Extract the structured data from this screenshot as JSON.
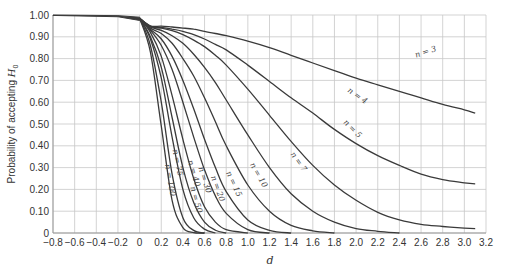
{
  "chart_data": {
    "type": "line",
    "title": "",
    "xlabel": "d",
    "ylabel": "Probability of accepting H0",
    "xlim": [
      -0.8,
      3.2
    ],
    "ylim": [
      0,
      1.0
    ],
    "grid": true,
    "legend": "inline curve labels",
    "x_ticks": [
      "-0.8",
      "-0.6",
      "-0.4",
      "-0.2",
      "0",
      "0.2",
      "0.4",
      "0.6",
      "0.8",
      "1.0",
      "1.2",
      "1.4",
      "1.6",
      "1.8",
      "2.0",
      "2.2",
      "2.4",
      "2.6",
      "2.8",
      "3.0",
      "3.2"
    ],
    "y_ticks": [
      "0",
      "0.10",
      "0.20",
      "0.30",
      "0.40",
      "0.50",
      "0.60",
      "0.70",
      "0.80",
      "0.90",
      "1.00"
    ],
    "x": [
      0,
      0.1,
      0.2,
      0.3,
      0.4,
      0.5,
      0.6,
      0.7,
      0.8,
      1.0,
      1.2,
      1.4,
      1.6,
      1.8,
      2.0,
      2.2,
      2.4,
      2.6,
      2.8,
      3.0,
      3.1
    ],
    "series": [
      {
        "name": "n = 3",
        "label_pos": [
          2.65,
          0.82,
          -18
        ],
        "values": [
          0.95,
          0.95,
          0.949,
          0.945,
          0.94,
          0.935,
          0.925,
          0.915,
          0.905,
          0.88,
          0.85,
          0.815,
          0.78,
          0.745,
          0.71,
          0.68,
          0.65,
          0.62,
          0.59,
          0.565,
          0.55
        ]
      },
      {
        "name": "n = 4",
        "label_pos": [
          2.0,
          0.62,
          35
        ],
        "values": [
          0.95,
          0.948,
          0.943,
          0.935,
          0.925,
          0.91,
          0.89,
          0.865,
          0.84,
          0.77,
          0.695,
          0.62,
          0.55,
          0.475,
          0.41,
          0.355,
          0.31,
          0.27,
          0.245,
          0.23,
          0.225
        ]
      },
      {
        "name": "n = 5",
        "label_pos": [
          1.95,
          0.47,
          45
        ],
        "values": [
          0.95,
          0.947,
          0.94,
          0.928,
          0.91,
          0.885,
          0.855,
          0.815,
          0.77,
          0.66,
          0.54,
          0.42,
          0.31,
          0.22,
          0.15,
          0.095,
          0.06,
          0.04,
          0.03,
          0.022,
          0.02
        ]
      },
      {
        "name": "n = 7",
        "label_pos": [
          1.45,
          0.32,
          55
        ],
        "values": [
          0.95,
          0.945,
          0.93,
          0.905,
          0.87,
          0.82,
          0.76,
          0.69,
          0.61,
          0.45,
          0.3,
          0.18,
          0.1,
          0.05,
          0.02,
          0.008,
          0.0,
          null,
          null,
          null,
          null
        ]
      },
      {
        "name": "n = 10",
        "label_pos": [
          1.08,
          0.26,
          60
        ],
        "values": [
          0.95,
          0.94,
          0.915,
          0.87,
          0.8,
          0.72,
          0.62,
          0.51,
          0.4,
          0.22,
          0.1,
          0.035,
          0.01,
          0.0,
          null,
          null,
          null,
          null,
          null,
          null,
          null
        ]
      },
      {
        "name": "n = 15",
        "label_pos": [
          0.85,
          0.22,
          65
        ],
        "values": [
          0.95,
          0.935,
          0.89,
          0.81,
          0.7,
          0.57,
          0.43,
          0.3,
          0.19,
          0.06,
          0.012,
          0.0,
          null,
          null,
          null,
          null,
          null,
          null,
          null,
          null,
          null
        ]
      },
      {
        "name": "n = 20",
        "label_pos": [
          0.7,
          0.2,
          70
        ],
        "values": [
          0.95,
          0.93,
          0.86,
          0.75,
          0.6,
          0.44,
          0.29,
          0.17,
          0.09,
          0.015,
          0.0,
          null,
          null,
          null,
          null,
          null,
          null,
          null,
          null,
          null,
          null
        ]
      },
      {
        "name": "n = 30",
        "label_pos": [
          0.58,
          0.24,
          72
        ],
        "values": [
          0.95,
          0.92,
          0.81,
          0.63,
          0.43,
          0.25,
          0.12,
          0.05,
          0.015,
          0.0,
          null,
          null,
          null,
          null,
          null,
          null,
          null,
          null,
          null,
          null,
          null
        ]
      },
      {
        "name": "n = 40",
        "label_pos": [
          0.48,
          0.27,
          74
        ],
        "values": [
          0.95,
          0.9,
          0.76,
          0.53,
          0.3,
          0.14,
          0.05,
          0.013,
          0.0,
          null,
          null,
          null,
          null,
          null,
          null,
          null,
          null,
          null,
          null,
          null,
          null
        ]
      },
      {
        "name": "n = 50",
        "label_pos": [
          0.5,
          0.15,
          75
        ],
        "values": [
          0.95,
          0.89,
          0.71,
          0.44,
          0.2,
          0.07,
          0.018,
          0.0,
          null,
          null,
          null,
          null,
          null,
          null,
          null,
          null,
          null,
          null,
          null,
          null,
          null
        ]
      },
      {
        "name": "n = 75",
        "label_pos": [
          0.33,
          0.32,
          78
        ],
        "values": [
          0.95,
          0.86,
          0.6,
          0.27,
          0.07,
          0.012,
          0.0,
          null,
          null,
          null,
          null,
          null,
          null,
          null,
          null,
          null,
          null,
          null,
          null,
          null,
          null
        ]
      },
      {
        "name": "n = 100",
        "label_pos": [
          0.26,
          0.24,
          80
        ],
        "values": [
          0.95,
          0.83,
          0.49,
          0.15,
          0.025,
          0.002,
          0.0,
          null,
          null,
          null,
          null,
          null,
          null,
          null,
          null,
          null,
          null,
          null,
          null,
          null,
          null
        ]
      }
    ],
    "left_segment": {
      "x": [
        -0.8,
        -0.2,
        0
      ],
      "value_top": 1.0,
      "value_bottom": 0.985,
      "note": "curves converge near 1.00 for d <= 0"
    }
  },
  "axes": {
    "ylabel_text": "Probability of accepting ",
    "ylabel_symbol": "H",
    "ylabel_subscript": "0",
    "xlabel_text": "d"
  },
  "style": {
    "curve_color": "#3a3a3a",
    "grid_color": "#c8c8c8",
    "text_color": "#333333"
  }
}
